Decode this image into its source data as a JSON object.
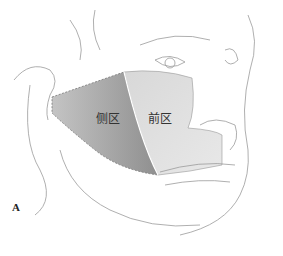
{
  "figure": {
    "panel_label": "A",
    "regions": [
      {
        "name": "lateral",
        "label": "侧区",
        "fill": "#a9a9a9"
      },
      {
        "name": "anterior",
        "label": "前区",
        "fill": "#d4d4d4"
      }
    ],
    "line_color": "#9a9a9a",
    "boundary_color": "#777777"
  }
}
